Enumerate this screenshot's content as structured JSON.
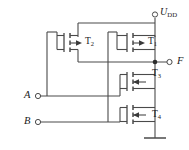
{
  "figure": {
    "type": "cmos-logic-circuit-schematic",
    "background_color": "#ffffff",
    "line_color": "#4a4a4a",
    "text_color": "#1a1a1a"
  },
  "labels": {
    "supply": {
      "name": "U",
      "subscript": "DD"
    },
    "output": {
      "name": "F"
    },
    "input_a": {
      "name": "A"
    },
    "input_b": {
      "name": "B"
    }
  },
  "transistors": [
    {
      "id": "T1",
      "name": "T",
      "subscript": "1",
      "type": "pmos",
      "arrow": "into-gate"
    },
    {
      "id": "T2",
      "name": "T",
      "subscript": "2",
      "type": "pmos",
      "arrow": "into-gate"
    },
    {
      "id": "T3",
      "name": "T",
      "subscript": "3",
      "type": "nmos",
      "arrow": "out-of-gate"
    },
    {
      "id": "T4",
      "name": "T",
      "subscript": "4",
      "type": "nmos",
      "arrow": "out-of-gate"
    }
  ],
  "terminals": [
    {
      "id": "UDD",
      "label": "U_DD",
      "x": 155,
      "y": 13
    },
    {
      "id": "F",
      "label": "F",
      "x": 172,
      "y": 62
    },
    {
      "id": "A",
      "label": "A",
      "x": 28,
      "y": 96
    },
    {
      "id": "B",
      "label": "B",
      "x": 28,
      "y": 122
    }
  ],
  "nodes": [
    {
      "id": "output-junction",
      "x": 155,
      "y": 62,
      "kind": "junction-dot"
    },
    {
      "id": "ground",
      "x": 155,
      "y": 138,
      "kind": "ground-symbol"
    }
  ]
}
